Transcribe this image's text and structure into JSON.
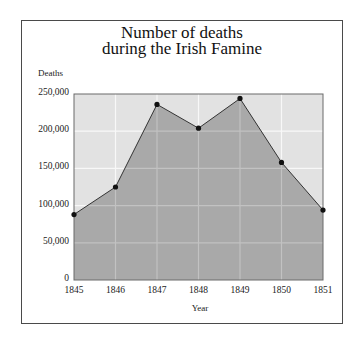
{
  "chart_data": {
    "type": "area",
    "title": "Number of deaths during the Irish Famine",
    "title_lines": [
      "Number of deaths",
      "during the Irish Famine"
    ],
    "xlabel": "Year",
    "ylabel": "Deaths",
    "categories": [
      "1845",
      "1846",
      "1847",
      "1848",
      "1849",
      "1850",
      "1851"
    ],
    "x": [
      1845,
      1846,
      1847,
      1848,
      1849,
      1850,
      1851
    ],
    "values": [
      88000,
      125000,
      236000,
      204000,
      244000,
      158000,
      94000
    ],
    "ylim": [
      0,
      250000
    ],
    "yticks": [
      0,
      50000,
      100000,
      150000,
      200000,
      250000
    ],
    "ytick_labels": [
      "0",
      "50,000",
      "100,000",
      "150,000",
      "200,000",
      "250,000"
    ],
    "grid": true,
    "legend": null,
    "colors": {
      "plot_background": "#e2e2e2",
      "area_fill": "#a9a9a9",
      "grid_on_background": "#f8f8f8",
      "grid_on_area": "#c2c2c2",
      "line": "#333333",
      "marker": "#111111"
    }
  }
}
